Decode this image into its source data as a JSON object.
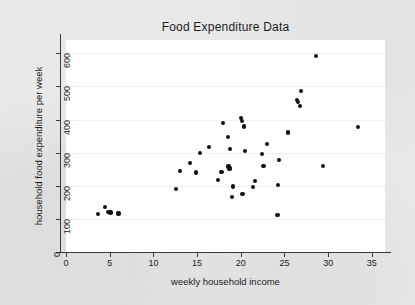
{
  "chart_data": {
    "type": "scatter",
    "title": "Food Expenditure Data",
    "xlabel": "weekly household income",
    "ylabel": "household food expenditure per week",
    "xlim": [
      0,
      36.5
    ],
    "ylim": [
      0,
      640
    ],
    "xticks": [
      0,
      5,
      10,
      15,
      20,
      25,
      30,
      35
    ],
    "yticks": [
      0,
      100,
      200,
      300,
      400,
      500,
      600
    ],
    "grid": "horizontal",
    "legend": null,
    "marker": {
      "shape": "circle",
      "color": "#111111",
      "size": 4
    },
    "plot_background": "#ffffff",
    "figure_background": "#e9e9e9",
    "points": [
      {
        "x": 3.7,
        "y": 115
      },
      {
        "x": 4.5,
        "y": 135
      },
      {
        "x": 4.8,
        "y": 120
      },
      {
        "x": 5.1,
        "y": 119
      },
      {
        "x": 6.0,
        "y": 116
      },
      {
        "x": 12.6,
        "y": 190
      },
      {
        "x": 13.0,
        "y": 244
      },
      {
        "x": 14.2,
        "y": 269
      },
      {
        "x": 14.9,
        "y": 240
      },
      {
        "x": 15.3,
        "y": 298
      },
      {
        "x": 16.4,
        "y": 318
      },
      {
        "x": 17.4,
        "y": 218
      },
      {
        "x": 17.8,
        "y": 242
      },
      {
        "x": 18.0,
        "y": 389
      },
      {
        "x": 18.5,
        "y": 346
      },
      {
        "x": 18.6,
        "y": 258
      },
      {
        "x": 18.7,
        "y": 250
      },
      {
        "x": 18.7,
        "y": 253
      },
      {
        "x": 18.8,
        "y": 311
      },
      {
        "x": 19.0,
        "y": 167
      },
      {
        "x": 19.1,
        "y": 198
      },
      {
        "x": 20.0,
        "y": 405
      },
      {
        "x": 20.1,
        "y": 396
      },
      {
        "x": 20.2,
        "y": 174
      },
      {
        "x": 20.4,
        "y": 379
      },
      {
        "x": 20.5,
        "y": 304
      },
      {
        "x": 21.4,
        "y": 196
      },
      {
        "x": 21.6,
        "y": 214
      },
      {
        "x": 22.4,
        "y": 296
      },
      {
        "x": 22.6,
        "y": 260
      },
      {
        "x": 23.0,
        "y": 326
      },
      {
        "x": 24.2,
        "y": 112
      },
      {
        "x": 24.3,
        "y": 203
      },
      {
        "x": 24.4,
        "y": 277
      },
      {
        "x": 25.4,
        "y": 361
      },
      {
        "x": 26.4,
        "y": 459
      },
      {
        "x": 26.5,
        "y": 452
      },
      {
        "x": 26.8,
        "y": 441
      },
      {
        "x": 26.9,
        "y": 485
      },
      {
        "x": 28.6,
        "y": 591
      },
      {
        "x": 29.4,
        "y": 260
      },
      {
        "x": 33.4,
        "y": 377
      }
    ]
  }
}
